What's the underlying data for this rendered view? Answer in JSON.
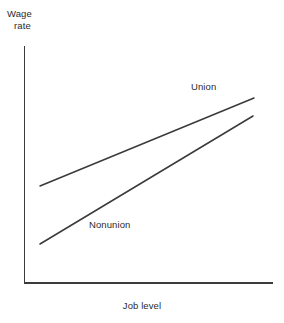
{
  "figure": {
    "width": 284,
    "height": 323,
    "background": "#ffffff",
    "line_color": "#3a3a3a",
    "axis_color": "#3b3b3b",
    "text_color": "#2b2b2b"
  },
  "labels": {
    "ylabel_line1": "Wage",
    "ylabel_line2": "rate",
    "xlabel": "Job level",
    "union": "Union",
    "nonunion": "Nonunion"
  },
  "chart_data": {
    "type": "line",
    "title": "",
    "subtitle": "",
    "xlabel": "Job level",
    "ylabel": "Wage rate",
    "grid": false,
    "legend": "inline-annotations",
    "axis_ticks": false,
    "xlim": [
      0,
      100
    ],
    "ylim": [
      0,
      100
    ],
    "annotations": [
      {
        "text": "Union",
        "x": 72,
        "y": 83
      },
      {
        "text": "Nonunion",
        "x": 28,
        "y": 27
      }
    ],
    "series": [
      {
        "name": "Union",
        "color": "#3a3a3a",
        "x": [
          6.7,
          100.0
        ],
        "values": [
          41.1,
          78.4
        ],
        "points": [
          {
            "x_px": 40,
            "y_px": 186
          },
          {
            "x_px": 254,
            "y_px": 98
          }
        ]
      },
      {
        "name": "Nonunion",
        "color": "#3a3a3a",
        "x": [
          6.7,
          99.6
        ],
        "values": [
          16.5,
          70.8
        ],
        "points": [
          {
            "x_px": 40,
            "y_px": 244
          },
          {
            "x_px": 253,
            "y_px": 116
          }
        ]
      }
    ],
    "axes_geometry_px": {
      "origin_x": 24.5,
      "origin_y": 283,
      "y_axis_top": 47,
      "x_axis_right": 272
    }
  }
}
